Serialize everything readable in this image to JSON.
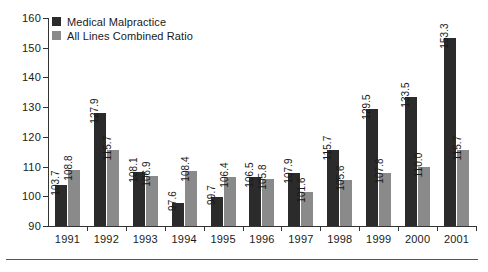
{
  "chart_data": {
    "type": "bar",
    "title": "",
    "subtitle": "",
    "xlabel": "",
    "ylabel": "",
    "categories": [
      "1991",
      "1992",
      "1993",
      "1994",
      "1995",
      "1996",
      "1997",
      "1998",
      "1999",
      "2000",
      "2001"
    ],
    "series": [
      {
        "name": "Medical Malpractice",
        "color": "#2b2b2b",
        "values": [
          103.7,
          127.9,
          108.1,
          97.6,
          99.7,
          106.5,
          107.9,
          115.7,
          129.5,
          133.5,
          153.3
        ],
        "labels": [
          "103.7",
          "127.9",
          "108.1",
          "97.6",
          "99.7",
          "106.5",
          "107.9",
          "115.7",
          "129.5",
          "133.5",
          "153.3"
        ]
      },
      {
        "name": "All Lines Combined Ratio",
        "color": "#8a8a8a",
        "values": [
          108.8,
          115.7,
          106.9,
          108.4,
          106.4,
          105.8,
          101.6,
          105.6,
          107.8,
          110.0,
          115.7
        ],
        "labels": [
          "108.8",
          "115.7",
          "106.9",
          "108.4",
          "106.4",
          "105.8",
          "101.6",
          "105.6",
          "107.8",
          "110.0",
          "115.7"
        ]
      }
    ],
    "ylim": [
      90,
      160
    ],
    "yticks": [
      90,
      100,
      110,
      120,
      130,
      140,
      150,
      160
    ],
    "ytick_labels": [
      "90",
      "100",
      "110",
      "120",
      "130",
      "140",
      "150",
      "160"
    ],
    "grid": false,
    "legend_position": "top-left",
    "data_labels": true,
    "data_label_rotation": -90
  },
  "legend": {
    "items": [
      {
        "label": "Medical Malpractice"
      },
      {
        "label": "All Lines Combined Ratio"
      }
    ]
  }
}
